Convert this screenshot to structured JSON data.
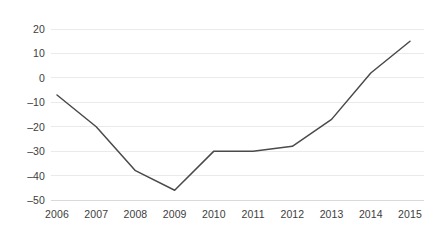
{
  "chart_data": {
    "type": "line",
    "title": "",
    "subtitle": "",
    "xlabel": "",
    "ylabel": "",
    "categories": [
      "2006",
      "2007",
      "2008",
      "2009",
      "2010",
      "2011",
      "2012",
      "2013",
      "2014",
      "2015"
    ],
    "values": [
      -7,
      -20,
      -38,
      -46,
      -30,
      -30,
      -28,
      -17,
      2,
      15
    ],
    "series": [
      {
        "name": "series-1",
        "values": [
          -7,
          -20,
          -38,
          -46,
          -30,
          -30,
          -28,
          -17,
          2,
          15
        ]
      }
    ],
    "ylim": [
      -50,
      20
    ],
    "yticks": [
      20,
      10,
      0,
      -10,
      -20,
      -30,
      -40,
      -50
    ],
    "ytick_labels": [
      "20",
      "10",
      "0",
      "–10",
      "–20",
      "–30",
      "–40",
      "–50"
    ],
    "xtick_labels": [
      "2006",
      "2007",
      "2008",
      "2009",
      "2010",
      "2011",
      "2012",
      "2013",
      "2014",
      "2015"
    ],
    "grid": true,
    "grid_axis": "y",
    "legend": false,
    "legend_position": "none",
    "markers": false,
    "annotations": []
  },
  "style": {
    "line_color": "#4a4a4a",
    "line_width": 1.5,
    "grid_color": "#eaeaea",
    "axis_color": "#d9d9d9",
    "tick_label_color": "#3d3d3d",
    "background": "#ffffff"
  },
  "geometry": {
    "plot_left": 57,
    "plot_right": 410,
    "plot_top": 29,
    "plot_bottom": 200,
    "grid_extend_right": 424
  }
}
